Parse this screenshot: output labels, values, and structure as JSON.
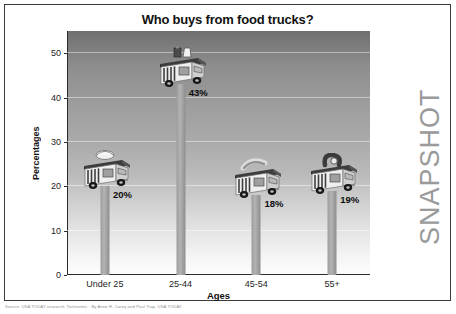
{
  "card": {
    "watermark": "SNAPSHOT",
    "source_note": "Source: USA TODAY research; Technomic  ·  By Anne R. Carey and Paul Trap, USA TODAY"
  },
  "chart_data": {
    "type": "bar",
    "title": "Who buys from food trucks?",
    "xlabel": "Ages",
    "ylabel": "Percentages",
    "categories": [
      "Under 25",
      "25-44",
      "45-54",
      "55+"
    ],
    "values": [
      20,
      43,
      18,
      19
    ],
    "value_labels": [
      "20%",
      "43%",
      "18%",
      "19%"
    ],
    "ylim": [
      0,
      55
    ],
    "yticks": [
      0,
      10,
      20,
      30,
      40,
      50
    ],
    "ytick_labels": [
      "0",
      "10",
      "20",
      "30",
      "40",
      "50"
    ],
    "grid": true,
    "legend": false,
    "icons": [
      "food-truck-icon",
      "food-truck-icon",
      "food-truck-icon",
      "food-truck-icon"
    ]
  },
  "colors": {
    "bar": "#a8a8a8",
    "axis": "#2b2b2b",
    "watermark": "#9a9a9a",
    "title": "#111111"
  }
}
